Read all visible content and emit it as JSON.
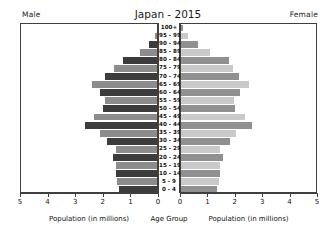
{
  "header": {
    "title": "Japan - 2015",
    "left_label": "Male",
    "right_label": "Female"
  },
  "axes": {
    "left_caption": "Population (in millions)",
    "center_caption": "Age Group",
    "right_caption": "Population (in millions)",
    "left_ticks": [
      "5",
      "4",
      "3",
      "2",
      "1",
      "0"
    ],
    "right_ticks": [
      "0",
      "1",
      "2",
      "3",
      "4",
      "5"
    ],
    "xmax": 5
  },
  "colors": {
    "male_dark": "#3c3c3c",
    "male_light": "#8c8c8c",
    "female_dark": "#909090",
    "female_light": "#c9c9c9",
    "axis": "#3f3f3f",
    "background": "#ffffff"
  },
  "chart_data": {
    "type": "bar",
    "title": "Japan - 2015",
    "xlabel": "Population (in millions)",
    "ylabel": "Age Group",
    "xlim": [
      0,
      5
    ],
    "grid": false,
    "legend": [
      "Male",
      "Female"
    ],
    "orientation": "population-pyramid",
    "categories": [
      "100+",
      "95 - 99",
      "90 - 94",
      "85 - 89",
      "80 - 84",
      "75 - 79",
      "70 - 74",
      "65 - 69",
      "60 - 64",
      "55 - 59",
      "50 - 54",
      "45 - 49",
      "40 - 44",
      "35 - 39",
      "30 - 34",
      "25 - 29",
      "20 - 24",
      "15 - 19",
      "10 - 14",
      "5 - 9",
      "0 - 4"
    ],
    "series": [
      {
        "name": "Male",
        "values": [
          0.01,
          0.08,
          0.28,
          0.62,
          1.22,
          1.55,
          1.9,
          2.35,
          2.08,
          1.87,
          1.95,
          2.3,
          2.6,
          2.05,
          1.82,
          1.48,
          1.6,
          1.5,
          1.5,
          1.45,
          1.38
        ]
      },
      {
        "name": "Female",
        "values": [
          0.06,
          0.24,
          0.62,
          1.05,
          1.75,
          1.9,
          2.1,
          2.48,
          2.14,
          1.92,
          1.98,
          2.32,
          2.58,
          2.02,
          1.78,
          1.44,
          1.54,
          1.43,
          1.42,
          1.38,
          1.32
        ]
      }
    ]
  }
}
